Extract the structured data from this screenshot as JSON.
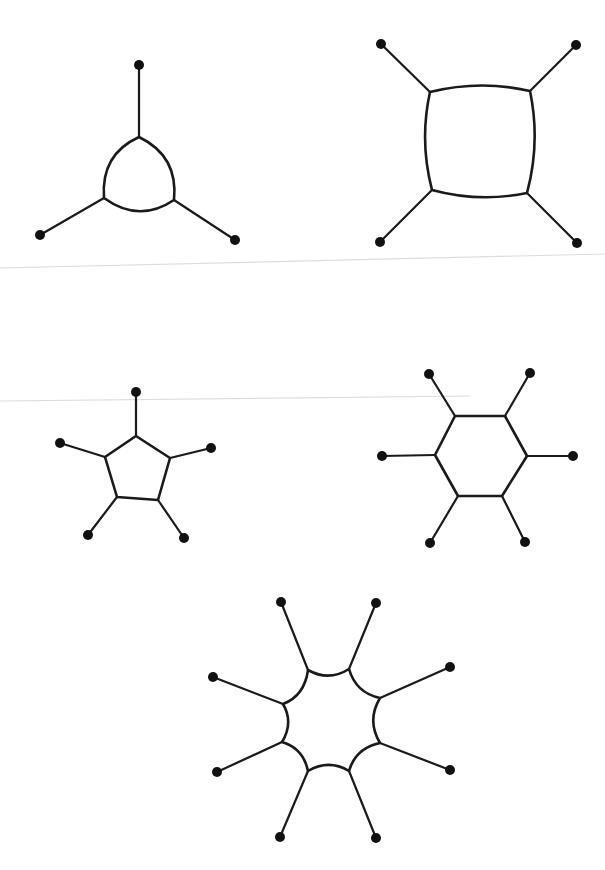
{
  "diagram": {
    "colors": {
      "stroke": "#1a1a1a",
      "dot": "#111111",
      "background": "#ffffff",
      "scan_line": "#dcdcdc"
    },
    "scan_lines": [
      {
        "x1": 0,
        "y1": 268,
        "x2": 605,
        "y2": 254
      },
      {
        "x1": 0,
        "y1": 401,
        "x2": 470,
        "y2": 396
      }
    ],
    "figures": [
      {
        "name": "triangle-ring",
        "ring_size": 3,
        "curvature": 0.35,
        "vertices": [
          [
            139,
            137
          ],
          [
            174,
            200
          ],
          [
            104,
            198
          ]
        ],
        "pendants": [
          [
            139,
            65
          ],
          [
            235,
            240
          ],
          [
            40,
            235
          ]
        ]
      },
      {
        "name": "square-ring",
        "ring_size": 4,
        "curvature": 0.12,
        "vertices": [
          [
            430,
            92
          ],
          [
            530,
            91
          ],
          [
            527,
            193
          ],
          [
            432,
            190
          ]
        ],
        "pendants": [
          [
            381,
            44
          ],
          [
            576,
            45
          ],
          [
            577,
            243
          ],
          [
            380,
            242
          ]
        ]
      },
      {
        "name": "pentagon-ring",
        "ring_size": 5,
        "curvature": 0.0,
        "vertices": [
          [
            136,
            436
          ],
          [
            170,
            458
          ],
          [
            158,
            500
          ],
          [
            117,
            497
          ],
          [
            105,
            457
          ]
        ],
        "pendants": [
          [
            136,
            392
          ],
          [
            211,
            448
          ],
          [
            184,
            538
          ],
          [
            88,
            535
          ],
          [
            60,
            443
          ]
        ]
      },
      {
        "name": "hexagon-ring",
        "ring_size": 6,
        "curvature": 0.0,
        "vertices": [
          [
            455,
            416
          ],
          [
            505,
            416
          ],
          [
            527,
            456
          ],
          [
            502,
            496
          ],
          [
            458,
            496
          ],
          [
            435,
            455
          ]
        ],
        "pendants": [
          [
            429,
            374
          ],
          [
            530,
            373
          ],
          [
            573,
            456
          ],
          [
            525,
            542
          ],
          [
            430,
            543
          ],
          [
            382,
            456
          ]
        ]
      },
      {
        "name": "octagon-ring",
        "ring_size": 8,
        "curvature": -0.3,
        "vertices": [
          [
            308,
            670
          ],
          [
            349,
            669
          ],
          [
            380,
            698
          ],
          [
            380,
            743
          ],
          [
            349,
            771
          ],
          [
            308,
            771
          ],
          [
            282,
            742
          ],
          [
            283,
            704
          ]
        ],
        "pendants": [
          [
            281,
            602
          ],
          [
            376,
            603
          ],
          [
            450,
            667
          ],
          [
            450,
            770
          ],
          [
            376,
            838
          ],
          [
            280,
            837
          ],
          [
            217,
            772
          ],
          [
            213,
            677
          ]
        ]
      }
    ],
    "dot_radius": 5
  }
}
